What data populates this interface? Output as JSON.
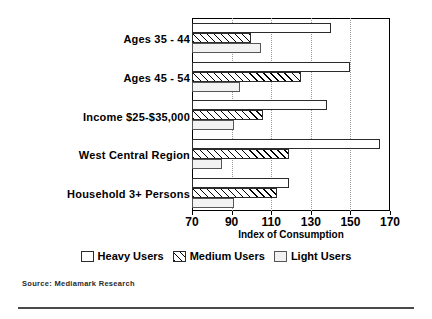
{
  "chart_data": {
    "type": "bar",
    "orientation": "horizontal",
    "title": "",
    "xlabel": "Index of Consumption",
    "ylabel": "",
    "xlim": [
      70,
      170
    ],
    "xticks": [
      70,
      90,
      110,
      130,
      150,
      170
    ],
    "grid": "vertical-dotted",
    "legend_position": "bottom-center",
    "categories": [
      "Ages 35 - 44",
      "Ages 45 - 54",
      "Income $25-$35,000",
      "West Central Region",
      "Household 3+ Persons"
    ],
    "series": [
      {
        "name": "Heavy Users",
        "values": [
          140,
          150,
          138,
          165,
          119
        ]
      },
      {
        "name": "Medium Users",
        "values": [
          100,
          125,
          106,
          119,
          113
        ]
      },
      {
        "name": "Light Users",
        "values": [
          105,
          94,
          91,
          85,
          91
        ]
      }
    ],
    "source": "Source: Mediamark Research",
    "colors": {
      "heavy": "#ffffff",
      "medium": "#ffffff",
      "light": "#f2f2f2",
      "outline": "#2b2b2b",
      "grid": "#9a9a9a"
    }
  }
}
